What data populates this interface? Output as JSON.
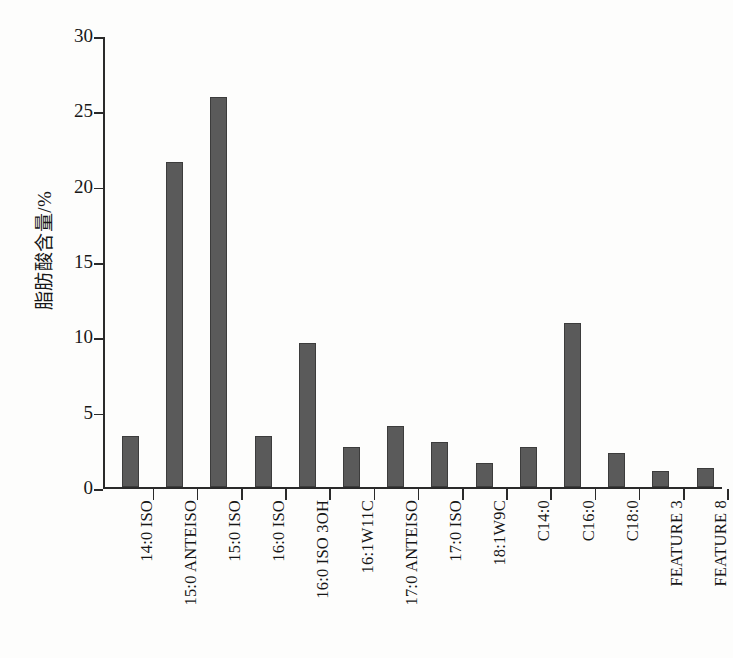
{
  "chart_data": {
    "type": "bar",
    "title": "",
    "subtitle": "",
    "xlabel": "",
    "ylabel": "脂肪酸含量/%",
    "ylim": [
      0,
      30
    ],
    "yticks": [
      0,
      5,
      10,
      15,
      20,
      25,
      30
    ],
    "ytick_labels": [
      "0",
      "5",
      "10",
      "15",
      "20",
      "25",
      "30"
    ],
    "grid": false,
    "legend": null,
    "bar_color": "#5a5a5a",
    "axis_color": "#2a2a2a",
    "categories": [
      "14:0 ISO",
      "15:0 ANTEISO",
      "15:0 ISO",
      "16:0 ISO",
      "16:0 ISO 3OH",
      "16:1W11C",
      "17:0 ANTEISO",
      "17:0 ISO",
      "18:1W9C",
      "C14:0",
      "C16:0",
      "C18:0",
      "FEATURE 3",
      "FEATURE 8"
    ],
    "values": [
      3.4,
      21.6,
      25.9,
      3.4,
      9.6,
      2.7,
      4.1,
      3.0,
      1.6,
      2.7,
      10.9,
      2.3,
      1.1,
      1.3
    ]
  }
}
